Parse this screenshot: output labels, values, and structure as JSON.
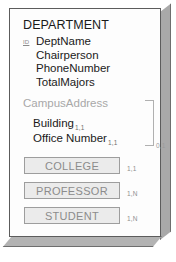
{
  "entity": {
    "name": "DEPARTMENT",
    "key_marker": "ID"
  },
  "attributes": [
    {
      "name": "DeptName",
      "is_key": true
    },
    {
      "name": "Chairperson",
      "is_key": false
    },
    {
      "name": "PhoneNumber",
      "is_key": false
    },
    {
      "name": "TotalMajors",
      "is_key": false
    }
  ],
  "composite": {
    "title": "CampusAddress",
    "group_cardinality": "0,1",
    "items": [
      {
        "name": "Building",
        "cardinality": "1,1"
      },
      {
        "name": "Office Number",
        "cardinality": "1,1"
      }
    ]
  },
  "relationships": [
    {
      "label": "COLLEGE",
      "cardinality": "1,1"
    },
    {
      "label": "PROFESSOR",
      "cardinality": "1,N"
    },
    {
      "label": "STUDENT",
      "cardinality": "1,N"
    }
  ],
  "colors": {
    "card_border": "#5c5c5c",
    "edge_fill": "#a9a9a9",
    "text_primary": "#1a1a1a",
    "text_muted": "#a8a8a8",
    "box_fill": "#ebebeb",
    "box_border": "#9d9d9d"
  }
}
